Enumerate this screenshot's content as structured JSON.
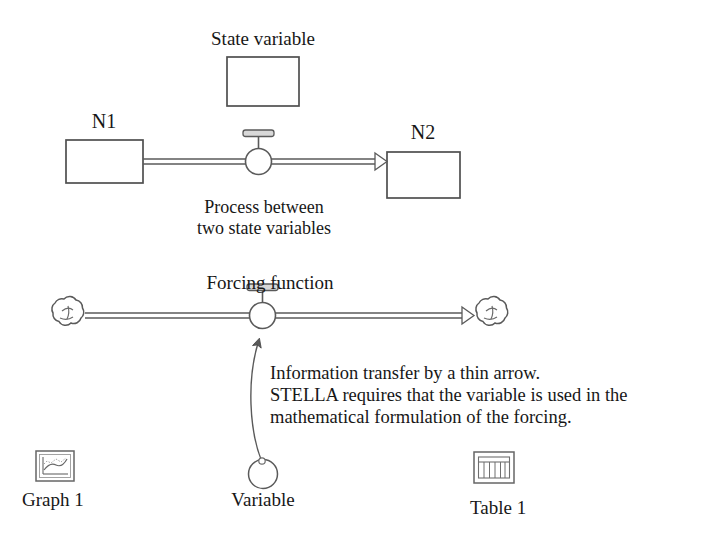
{
  "diagram": {
    "background_color": "#ffffff",
    "stroke_color": "#4d4d4d",
    "text_color": "#171717"
  },
  "labels": {
    "state_variable": "State variable",
    "n1": "N1",
    "n2": "N2",
    "process_line1": "Process between",
    "process_line2": "two state variables",
    "forcing_function": "Forcing function",
    "info_line1": "Information transfer by a thin arrow.",
    "info_line2": "STELLA requires that the variable is used in the",
    "info_line3": "mathematical formulation of the forcing.",
    "graph1": "Graph 1",
    "variable": "Variable",
    "table1": "Table 1"
  },
  "elements": {
    "state_variable_box": {
      "name": "state-variable-box",
      "shape": "rectangle"
    },
    "n1_box": {
      "name": "stock-n1",
      "shape": "rectangle"
    },
    "n2_box": {
      "name": "stock-n2",
      "shape": "rectangle"
    },
    "flow_valve_top": {
      "name": "flow-valve",
      "shape": "valve-circle-with-handle"
    },
    "flow_valve_bottom": {
      "name": "forcing-valve",
      "shape": "valve-circle-with-handle"
    },
    "source_cloud": {
      "name": "source-cloud",
      "shape": "cloud"
    },
    "sink_cloud": {
      "name": "sink-cloud",
      "shape": "cloud"
    },
    "converter": {
      "name": "converter-circle",
      "shape": "circle"
    },
    "connector_arrow": {
      "name": "information-connector",
      "shape": "thin-curved-arrow"
    },
    "graph_icon": {
      "name": "graph-icon",
      "shape": "framed-line-chart"
    },
    "table_icon": {
      "name": "table-icon",
      "shape": "framed-grid"
    }
  }
}
